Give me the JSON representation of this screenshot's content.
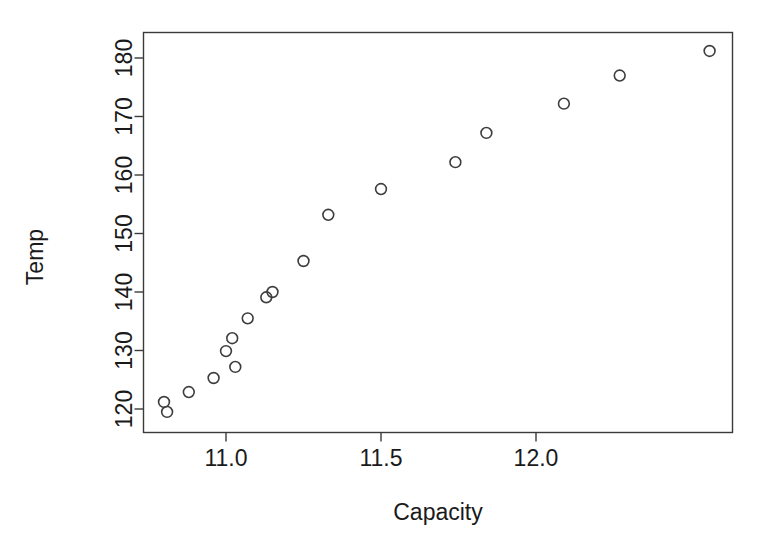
{
  "chart_data": {
    "type": "scatter",
    "title": "",
    "xlabel": "Capacity",
    "ylabel": "Temp",
    "xlim": [
      10.74,
      12.37
    ],
    "ylim": [
      117.6,
      182.8
    ],
    "grid": false,
    "legend": "none",
    "marker": "open-circle",
    "xticks": [
      11.0,
      11.5,
      12.0
    ],
    "xtick_labels": [
      "11.0",
      "11.5",
      "12.0"
    ],
    "yticks": [
      120,
      130,
      140,
      150,
      160,
      170,
      180
    ],
    "ytick_labels": [
      "120",
      "130",
      "140",
      "150",
      "160",
      "170",
      "180"
    ],
    "x": [
      10.8,
      10.81,
      10.88,
      10.96,
      11.0,
      11.03,
      11.02,
      11.07,
      11.13,
      11.15,
      11.25,
      11.33,
      11.5,
      11.74,
      11.84,
      12.09,
      12.27,
      12.56
    ],
    "y": [
      121.2,
      119.5,
      122.9,
      125.3,
      129.9,
      127.2,
      132.1,
      135.5,
      139.1,
      140.0,
      145.3,
      153.2,
      157.6,
      162.2,
      167.2,
      172.2,
      177.0,
      181.2
    ],
    "points": [
      {
        "x": 10.8,
        "y": 121.2
      },
      {
        "x": 10.81,
        "y": 119.5
      },
      {
        "x": 10.88,
        "y": 122.9
      },
      {
        "x": 10.96,
        "y": 125.3
      },
      {
        "x": 11.0,
        "y": 129.9
      },
      {
        "x": 11.03,
        "y": 127.2
      },
      {
        "x": 11.02,
        "y": 132.1
      },
      {
        "x": 11.07,
        "y": 135.5
      },
      {
        "x": 11.13,
        "y": 139.1
      },
      {
        "x": 11.15,
        "y": 140.0
      },
      {
        "x": 11.25,
        "y": 145.3
      },
      {
        "x": 11.33,
        "y": 153.2
      },
      {
        "x": 11.5,
        "y": 157.6
      },
      {
        "x": 11.74,
        "y": 162.2
      },
      {
        "x": 11.84,
        "y": 167.2
      },
      {
        "x": 12.09,
        "y": 172.2
      },
      {
        "x": 12.27,
        "y": 177.0
      },
      {
        "x": 12.56,
        "y": 181.2
      }
    ]
  },
  "axes": {
    "y_title": "Temp",
    "x_title": "Capacity"
  },
  "colors": {
    "marker_stroke": "#3d3d3d",
    "axis": "#3a3a3a",
    "text": "#1a1a1a",
    "background": "#ffffff"
  }
}
